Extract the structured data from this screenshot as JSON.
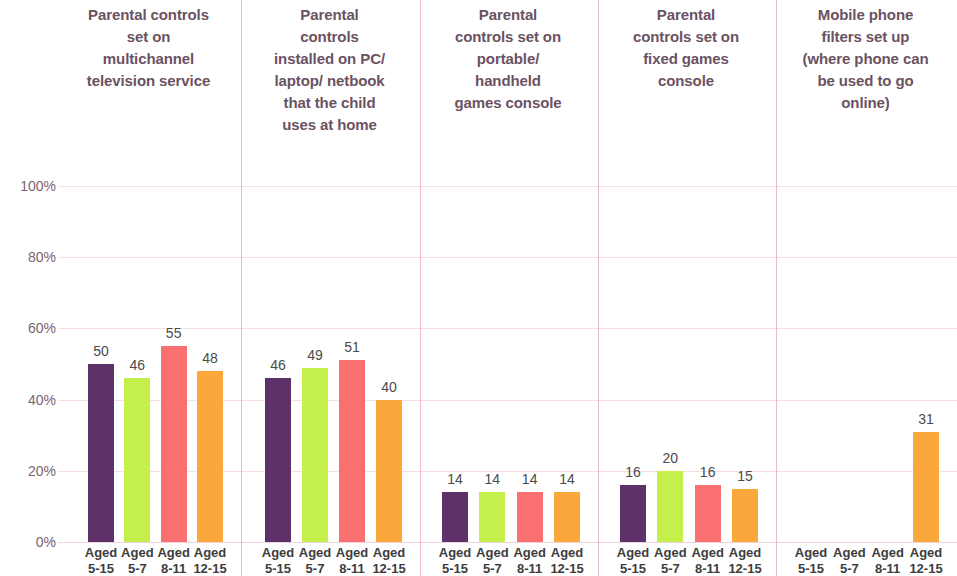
{
  "chart_data": {
    "type": "bar",
    "title": "",
    "subtitle": "",
    "xlabel": "",
    "ylabel": "",
    "ylim": [
      0,
      100
    ],
    "ytick_labels": [
      "100%",
      "80%",
      "60%",
      "40%",
      "20%",
      "0%"
    ],
    "ytick_values": [
      100,
      80,
      60,
      40,
      20,
      0
    ],
    "grid": true,
    "legend_position": "none",
    "value_suffix": "%",
    "categories": [
      "Aged 5-15",
      "Aged 5-7",
      "Aged 8-11",
      "Aged 12-15"
    ],
    "category_lines": [
      {
        "l1": "Aged",
        "l2": "5-15"
      },
      {
        "l1": "Aged",
        "l2": "5-7"
      },
      {
        "l1": "Aged",
        "l2": "8-11"
      },
      {
        "l1": "Aged",
        "l2": "12-15"
      }
    ],
    "series_colors": [
      "#5e3268",
      "#c5f04c",
      "#fa7070",
      "#faa83c"
    ],
    "groups": [
      {
        "label": "Parental controls set on multichannel television service",
        "label_lines": [
          "Parental controls",
          "set on",
          "multichannel",
          "television service"
        ],
        "values": [
          50,
          46,
          55,
          48
        ],
        "value_labels": [
          "50",
          "46",
          "55",
          "48"
        ]
      },
      {
        "label": "Parental controls installed on PC/ laptop/ netbook that the child uses at home",
        "label_lines": [
          "Parental",
          "controls",
          "installed on PC/",
          "laptop/ netbook",
          "that the child",
          "uses at home"
        ],
        "values": [
          46,
          49,
          51,
          40
        ],
        "value_labels": [
          "46",
          "49",
          "51",
          "40"
        ]
      },
      {
        "label": "Parental controls set on portable/ handheld games console",
        "label_lines": [
          "Parental",
          "controls set on",
          "portable/",
          "handheld",
          "games console"
        ],
        "values": [
          14,
          14,
          14,
          14
        ],
        "value_labels": [
          "14",
          "14",
          "14",
          "14"
        ]
      },
      {
        "label": "Parental controls set on fixed games console",
        "label_lines": [
          "Parental",
          "controls set on",
          "fixed games",
          "console"
        ],
        "values": [
          16,
          20,
          16,
          15
        ],
        "value_labels": [
          "16",
          "20",
          "16",
          "15"
        ]
      },
      {
        "label": "Mobile phone filters set up (where phone can be used to go online)",
        "label_lines": [
          "Mobile phone",
          "filters set up",
          "(where phone can",
          "be used to go",
          "online)"
        ],
        "values": [
          null,
          null,
          null,
          31
        ],
        "value_labels": [
          "",
          "",
          "",
          "31"
        ]
      }
    ]
  },
  "colors": {
    "gridline": "#f6dfe6",
    "separator": "#f0b9c8",
    "header_text": "#6b5263",
    "axis_text": "#7b6270",
    "value_text": "#4a4a4a",
    "tick_text": "#3d3d3d",
    "background": "#ffffff"
  }
}
